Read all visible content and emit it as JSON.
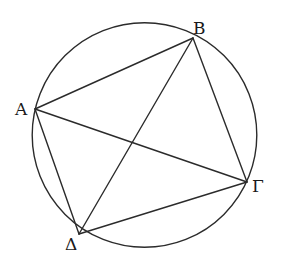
{
  "figure": {
    "type": "cyclic quadrilateral inscribed in a circle with both diagonals",
    "vertices": [
      {
        "id": "A",
        "label": "Α"
      },
      {
        "id": "B",
        "label": "Β"
      },
      {
        "id": "G",
        "label": "Γ"
      },
      {
        "id": "D",
        "label": "Δ"
      }
    ],
    "sides": [
      [
        "A",
        "B"
      ],
      [
        "B",
        "G"
      ],
      [
        "G",
        "D"
      ],
      [
        "D",
        "A"
      ]
    ],
    "diagonals": [
      [
        "A",
        "G"
      ],
      [
        "B",
        "D"
      ]
    ],
    "colors": {
      "line": "#2b2b2b",
      "label": "#1a1a1a",
      "background": "#ffffff"
    }
  }
}
